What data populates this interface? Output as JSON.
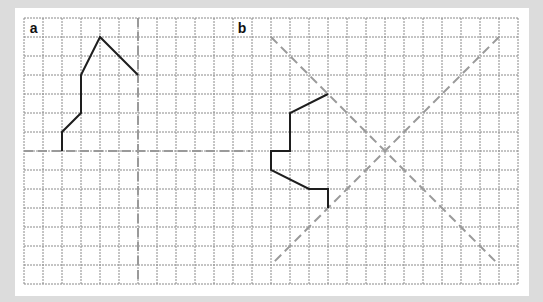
{
  "figure": {
    "grid": {
      "origin_px": [
        24,
        18
      ],
      "cell_px": 19,
      "cols": 26,
      "rows": 14,
      "line_color": "#8a8a8a"
    },
    "colors": {
      "shape": "#1e1e1e",
      "mirror": "#9a9a9a",
      "background": "#dcdcdc",
      "panel": "#ffffff"
    },
    "panels": [
      {
        "label": "a",
        "label_pos": [
          0.3,
          1
        ],
        "shape": [
          [
            2,
            7
          ],
          [
            2,
            6
          ],
          [
            3,
            5
          ],
          [
            3,
            3
          ],
          [
            4,
            1
          ],
          [
            6,
            3
          ]
        ],
        "mirror_lines": [
          {
            "from": [
              6,
              0
            ],
            "to": [
              6,
              14
            ]
          },
          {
            "from": [
              0,
              7
            ],
            "to": [
              11.9,
              7
            ]
          }
        ]
      },
      {
        "label": "b",
        "label_pos": [
          11.25,
          1
        ],
        "shape": [
          [
            16,
            4
          ],
          [
            14,
            5
          ],
          [
            14,
            7
          ],
          [
            13,
            7
          ],
          [
            13,
            8
          ],
          [
            15,
            9
          ],
          [
            16,
            9
          ],
          [
            16,
            10
          ]
        ],
        "mirror_lines": [
          {
            "from": [
              13,
              1
            ],
            "to": [
              25,
              13
            ]
          },
          {
            "from": [
              25,
              1
            ],
            "to": [
              13,
              13
            ]
          }
        ]
      }
    ]
  }
}
